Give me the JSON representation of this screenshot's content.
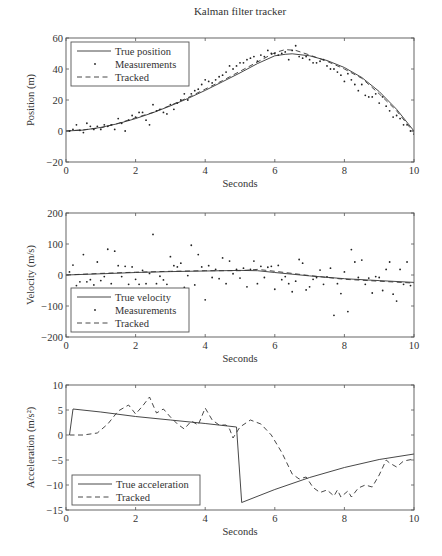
{
  "figure": {
    "title": "Kalman filter tracker"
  },
  "chart_data": [
    {
      "type": "line",
      "id": "position",
      "title": "Kalman filter tracker",
      "xlabel": "Seconds",
      "ylabel": "Position (m)",
      "xlim": [
        0,
        10
      ],
      "ylim": [
        -20,
        60
      ],
      "xticks": [
        0,
        2,
        4,
        6,
        8,
        10
      ],
      "yticks": [
        -20,
        0,
        20,
        40,
        60
      ],
      "grid": false,
      "legend_position": "upper left",
      "legend": [
        "True position",
        "Measurements",
        "Tracked"
      ],
      "series": [
        {
          "name": "True position",
          "style": "solid",
          "x": [
            0,
            0.5,
            1,
            1.5,
            2,
            2.5,
            3,
            3.5,
            4,
            4.5,
            5,
            5.5,
            6,
            6.3,
            6.5,
            7,
            7.5,
            8,
            8.5,
            9,
            9.5,
            10
          ],
          "y": [
            0,
            0.6,
            2.3,
            4.8,
            8,
            11.8,
            16.2,
            21,
            26.2,
            31.8,
            37.5,
            43.5,
            48.5,
            49.5,
            49.8,
            48.5,
            45.5,
            41,
            34.5,
            25.5,
            14,
            0
          ]
        },
        {
          "name": "Measurements",
          "style": "dots",
          "x": [
            0.1,
            0.2,
            0.3,
            0.4,
            0.5,
            0.6,
            0.7,
            0.8,
            0.9,
            1.0,
            1.1,
            1.2,
            1.3,
            1.4,
            1.5,
            1.6,
            1.7,
            1.8,
            1.9,
            2.0,
            2.1,
            2.2,
            2.3,
            2.4,
            2.5,
            2.6,
            2.7,
            2.8,
            2.9,
            3.0,
            3.1,
            3.2,
            3.3,
            3.4,
            3.5,
            3.6,
            3.7,
            3.8,
            3.9,
            4.0,
            4.1,
            4.2,
            4.3,
            4.4,
            4.5,
            4.6,
            4.7,
            4.8,
            4.9,
            5.0,
            5.1,
            5.2,
            5.3,
            5.4,
            5.5,
            5.6,
            5.7,
            5.8,
            5.9,
            6.0,
            6.1,
            6.2,
            6.3,
            6.4,
            6.5,
            6.6,
            6.7,
            6.8,
            6.9,
            7.0,
            7.1,
            7.2,
            7.3,
            7.4,
            7.5,
            7.6,
            7.7,
            7.8,
            7.9,
            8.0,
            8.1,
            8.2,
            8.3,
            8.4,
            8.5,
            8.6,
            8.7,
            8.8,
            8.9,
            9.0,
            9.1,
            9.2,
            9.3,
            9.4,
            9.5,
            9.6,
            9.7,
            9.8,
            9.9,
            10.0
          ],
          "y": [
            0,
            1,
            4,
            0.5,
            -1,
            5,
            3,
            1,
            3,
            1,
            4,
            3,
            4,
            1,
            8,
            5,
            0,
            7,
            10,
            9,
            12,
            12,
            7,
            4,
            17,
            13,
            14,
            12,
            11,
            17,
            14,
            18,
            20,
            24,
            20,
            24,
            26,
            27,
            30,
            33,
            32,
            31,
            33,
            35,
            36,
            38,
            42,
            40,
            42,
            44,
            44,
            46,
            47,
            48,
            45,
            49,
            48,
            52,
            50,
            50,
            49,
            50,
            51,
            46,
            52,
            55,
            48,
            47,
            48,
            46,
            44,
            44,
            45,
            46,
            42,
            40,
            40,
            38,
            36,
            32,
            37,
            33,
            30,
            26,
            30,
            23,
            22,
            22,
            24,
            18,
            22,
            16,
            13,
            9,
            10,
            8,
            4,
            4,
            0,
            -2
          ]
        },
        {
          "name": "Tracked",
          "style": "dashed",
          "x": [
            0,
            0.5,
            1,
            1.5,
            2,
            2.5,
            3,
            3.5,
            4,
            4.5,
            5,
            5.5,
            6,
            6.3,
            6.6,
            7,
            7.5,
            8,
            8.5,
            9,
            9.5,
            10
          ],
          "y": [
            0,
            0.8,
            2,
            5,
            8.5,
            12,
            16.5,
            21.5,
            27,
            32.5,
            38.5,
            44.5,
            50.5,
            52.5,
            52,
            49,
            45,
            40,
            34,
            24,
            13,
            -1
          ]
        }
      ]
    },
    {
      "type": "line",
      "id": "velocity",
      "xlabel": "Seconds",
      "ylabel": "Velocity (m/s)",
      "xlim": [
        0,
        10
      ],
      "ylim": [
        -200,
        200
      ],
      "xticks": [
        0,
        2,
        4,
        6,
        8,
        10
      ],
      "yticks": [
        -200,
        -100,
        0,
        100,
        200
      ],
      "grid": false,
      "legend_position": "lower left",
      "legend": [
        "True velocity",
        "Measurements",
        "Tracked"
      ],
      "series": [
        {
          "name": "True velocity",
          "style": "solid",
          "x": [
            0,
            1,
            2,
            3,
            4,
            5,
            5.5,
            6,
            7,
            8,
            9,
            10
          ],
          "y": [
            0,
            4,
            8,
            11,
            13,
            15,
            14,
            8,
            -3,
            -12,
            -18,
            -24
          ]
        },
        {
          "name": "Measurements",
          "style": "dots",
          "x": [
            0.1,
            0.2,
            0.3,
            0.4,
            0.5,
            0.6,
            0.7,
            0.8,
            0.9,
            1.0,
            1.1,
            1.2,
            1.3,
            1.4,
            1.5,
            1.6,
            1.7,
            1.8,
            1.9,
            2.0,
            2.1,
            2.2,
            2.3,
            2.4,
            2.5,
            2.6,
            2.7,
            2.8,
            2.9,
            3.0,
            3.1,
            3.2,
            3.3,
            3.4,
            3.5,
            3.6,
            3.7,
            3.8,
            3.9,
            4.0,
            4.1,
            4.2,
            4.3,
            4.4,
            4.5,
            4.6,
            4.7,
            4.8,
            4.9,
            5.0,
            5.1,
            5.2,
            5.3,
            5.4,
            5.5,
            5.6,
            5.7,
            5.8,
            5.9,
            6.0,
            6.1,
            6.2,
            6.3,
            6.4,
            6.5,
            6.6,
            6.7,
            6.8,
            6.9,
            7.0,
            7.1,
            7.2,
            7.3,
            7.4,
            7.5,
            7.6,
            7.7,
            7.8,
            7.9,
            8.0,
            8.1,
            8.2,
            8.3,
            8.4,
            8.5,
            8.6,
            8.7,
            8.8,
            8.9,
            9.0,
            9.1,
            9.2,
            9.3,
            9.4,
            9.5,
            9.6,
            9.7,
            9.8,
            9.9
          ],
          "y": [
            10,
            32,
            -34,
            -22,
            66,
            -22,
            -15,
            -32,
            42,
            -18,
            -5,
            83,
            -28,
            77,
            30,
            -5,
            28,
            -30,
            26,
            -14,
            -30,
            15,
            -28,
            5,
            131,
            -28,
            -4,
            -16,
            -30,
            59,
            30,
            26,
            38,
            -40,
            -2,
            96,
            -32,
            66,
            26,
            -80,
            30,
            -8,
            18,
            -12,
            55,
            -28,
            45,
            4,
            18,
            -10,
            22,
            -38,
            18,
            45,
            -28,
            28,
            -8,
            25,
            28,
            -46,
            31,
            -15,
            -5,
            -28,
            -54,
            -20,
            50,
            38,
            -48,
            -38,
            -14,
            -8,
            16,
            -30,
            -6,
            22,
            -130,
            -28,
            -60,
            10,
            -118,
            82,
            42,
            -8,
            48,
            -30,
            -10,
            -58,
            -5,
            -8,
            -50,
            18,
            42,
            -62,
            -84,
            18,
            -30,
            42,
            -34
          ]
        },
        {
          "name": "Tracked",
          "style": "dashed",
          "x": [
            0,
            1,
            2,
            3,
            4,
            5,
            5.5,
            6,
            6.5,
            7,
            8,
            9,
            10
          ],
          "y": [
            0,
            5,
            9,
            12,
            14,
            14,
            18,
            12,
            5,
            -2,
            -14,
            -20,
            -26
          ]
        }
      ]
    },
    {
      "type": "line",
      "id": "acceleration",
      "xlabel": "Seconds",
      "ylabel": "Acceleration (m/s²)",
      "xlim": [
        0,
        10
      ],
      "ylim": [
        -15,
        10
      ],
      "xticks": [
        0,
        2,
        4,
        6,
        8,
        10
      ],
      "yticks": [
        -15,
        -10,
        -5,
        0,
        5,
        10
      ],
      "grid": false,
      "legend_position": "lower left",
      "legend": [
        "True acceleration",
        "Tracked"
      ],
      "series": [
        {
          "name": "True acceleration",
          "style": "solid",
          "x": [
            0.1,
            0.2,
            1,
            2,
            3,
            4,
            4.9,
            4.9,
            5.05,
            5.05,
            6,
            7,
            8,
            9,
            10
          ],
          "y": [
            0,
            5.2,
            4.6,
            3.7,
            3.0,
            2.3,
            1.6,
            1.6,
            -13.5,
            -13.5,
            -10.9,
            -8.5,
            -6.5,
            -4.9,
            -3.8
          ]
        },
        {
          "name": "Tracked",
          "style": "dashed",
          "x": [
            0.1,
            0.5,
            0.9,
            1.2,
            1.5,
            1.8,
            2.0,
            2.2,
            2.4,
            2.6,
            2.8,
            3.0,
            3.2,
            3.4,
            3.6,
            3.8,
            4.0,
            4.2,
            4.4,
            4.6,
            4.7,
            4.8,
            5.0,
            5.3,
            5.6,
            5.9,
            6.2,
            6.5,
            6.7,
            6.9,
            7.1,
            7.3,
            7.5,
            7.7,
            7.8,
            7.9,
            8.1,
            8.2,
            8.4,
            8.6,
            8.8,
            9.0,
            9.2,
            9.3,
            9.5,
            9.7,
            10
          ],
          "y": [
            0,
            0,
            0.4,
            2.2,
            4.8,
            6.0,
            4.2,
            5.8,
            7.6,
            4.4,
            5.2,
            3.6,
            2.2,
            1.2,
            2.8,
            2.0,
            5.4,
            3.0,
            2.0,
            2.0,
            1.2,
            -0.6,
            1.6,
            3.0,
            2.2,
            0,
            -3.5,
            -7.8,
            -8.8,
            -8.4,
            -10.5,
            -11.5,
            -11.0,
            -12.2,
            -11.0,
            -12.4,
            -11.2,
            -12.4,
            -10.6,
            -10.0,
            -10.4,
            -8.0,
            -5.0,
            -5.6,
            -6.4,
            -5.2,
            -4.8
          ]
        }
      ]
    }
  ]
}
